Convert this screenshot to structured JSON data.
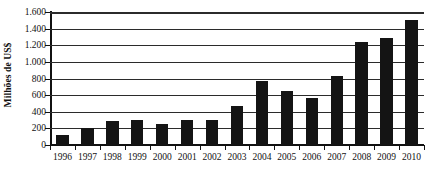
{
  "chart_data": {
    "type": "bar",
    "title": "",
    "xlabel": "",
    "ylabel": "Milhões de US$",
    "categories": [
      "1996",
      "1997",
      "1998",
      "1999",
      "2000",
      "2001",
      "2002",
      "2003",
      "2004",
      "2005",
      "2006",
      "2007",
      "2008",
      "2009",
      "2010"
    ],
    "values": [
      120,
      205,
      285,
      295,
      255,
      300,
      300,
      470,
      770,
      650,
      560,
      830,
      1240,
      1290,
      1500
    ],
    "ylim": [
      0,
      1600
    ],
    "ytick_values": [
      0,
      200,
      400,
      600,
      800,
      1000,
      1200,
      1400,
      1600
    ],
    "ytick_labels": [
      "0",
      "200",
      "400",
      "600",
      "800",
      "1.000",
      "1.200",
      "1.400",
      "1.600"
    ],
    "grid": true,
    "legend": false,
    "bar_color": "#141414",
    "axis_color": "#111111",
    "background_color": "#ffffff"
  }
}
